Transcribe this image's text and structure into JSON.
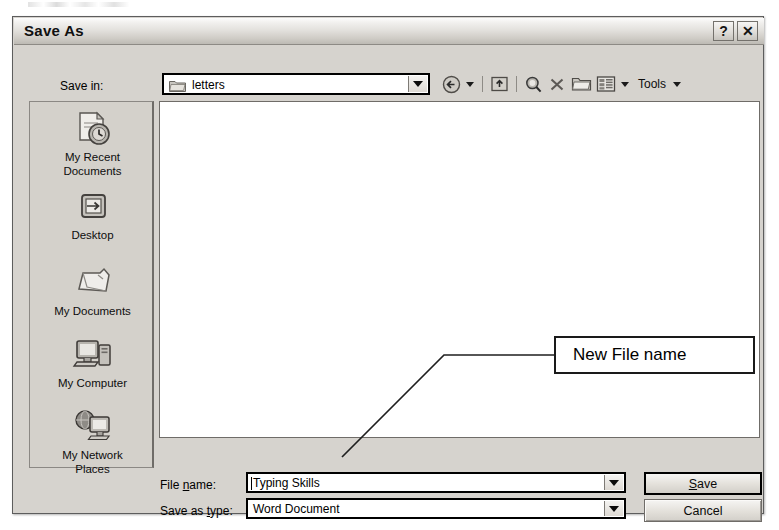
{
  "window": {
    "title": "Save As",
    "help_button": "?",
    "close_button": "✕",
    "help_icon": "question-mark-icon",
    "close_icon": "close-x-icon"
  },
  "save_in": {
    "label": "Save in:",
    "value": "letters",
    "icon": "folder-icon",
    "dropdown_icon": "chevron-down-icon"
  },
  "toolbar": {
    "back_icon": "back-arrow-icon",
    "back_dropdown_icon": "chevron-down-icon",
    "up_icon": "up-one-level-icon",
    "search_icon": "search-magnifier-icon",
    "delete_icon": "delete-x-icon",
    "new_folder_icon": "new-folder-icon",
    "views_icon": "views-grid-icon",
    "views_dropdown_icon": "chevron-down-icon",
    "tools_label": "Tools",
    "tools_dropdown_icon": "chevron-down-icon"
  },
  "places": [
    {
      "label_line1": "My Recent",
      "label_line2": "Documents",
      "icon": "recent-documents-icon"
    },
    {
      "label_line1": "Desktop",
      "label_line2": "",
      "icon": "desktop-icon"
    },
    {
      "label_line1": "My Documents",
      "label_line2": "",
      "icon": "my-documents-folder-icon"
    },
    {
      "label_line1": "My Computer",
      "label_line2": "",
      "icon": "my-computer-icon"
    },
    {
      "label_line1": "My Network",
      "label_line2": "Places",
      "icon": "network-places-icon"
    }
  ],
  "file_list": {
    "items": [],
    "empty": true
  },
  "form": {
    "filename_label_pre": "File ",
    "filename_label_accel": "n",
    "filename_label_post": "ame:",
    "filename_value": "Typing Skills",
    "filename_dropdown_icon": "chevron-down-icon",
    "savetype_label_pre": "Save as ",
    "savetype_label_accel": "t",
    "savetype_label_post": "ype:",
    "savetype_value": "Word Document",
    "savetype_dropdown_icon": "chevron-down-icon"
  },
  "buttons": {
    "save_accel": "S",
    "save_rest": "ave",
    "cancel": "Cancel"
  },
  "annotation": {
    "callout_text": "New File name",
    "leader_icon": "leader-line"
  },
  "colors": {
    "dialog_face": "#d6d3ce",
    "places_face": "#d4d1cb",
    "field_white": "#ffffff",
    "border_dark": "#000000",
    "text": "#000000"
  }
}
